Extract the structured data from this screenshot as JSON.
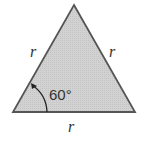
{
  "figure": {
    "shape": "equilateral-triangle",
    "fill_color": "#cfcfcf",
    "stroke_color": "#555555",
    "labels": {
      "left_side": "r",
      "right_side": "r",
      "base": "r",
      "angle": "60°"
    }
  }
}
